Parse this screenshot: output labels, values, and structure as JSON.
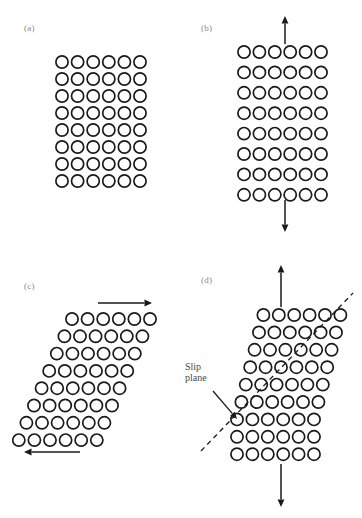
{
  "figure": {
    "background_color": "#ffffff",
    "atom_stroke_color": "#1a1a1a",
    "arrow_color": "#1a1a1a",
    "label_color": "#8a8a8a",
    "annotation_color": "#4a4a4a"
  },
  "panels": [
    {
      "id": "a",
      "label": "(a)",
      "state": "undeformed",
      "lattice": {
        "columns": 6,
        "rows": 8,
        "radius": 6.1,
        "col_spacing": 15.6,
        "row_spacing": 17.0,
        "origin_x": 62,
        "origin_y": 62,
        "row_shear": 0,
        "slip_row_offset": 0
      },
      "arrows": []
    },
    {
      "id": "b",
      "label": "(b)",
      "state": "elastic-tension",
      "lattice": {
        "columns": 6,
        "rows": 8,
        "radius": 6.1,
        "col_spacing": 15.4,
        "row_spacing": 20.4,
        "origin_x": 63,
        "origin_y": 52,
        "row_shear": 0,
        "slip_row_offset": 0
      },
      "arrows": [
        {
          "name": "tension-arrow-up",
          "direction": "up",
          "x": 104,
          "from_y": 44,
          "to_y": 16
        },
        {
          "name": "tension-arrow-down",
          "direction": "down",
          "x": 104,
          "from_y": 200,
          "to_y": 232
        }
      ]
    },
    {
      "id": "c",
      "label": "(c)",
      "state": "elastic-shear",
      "lattice": {
        "columns": 6,
        "rows": 8,
        "radius": 6.1,
        "col_spacing": 15.6,
        "row_spacing": 17.3,
        "origin_x": 72,
        "origin_y": 60,
        "row_shear": -7.6,
        "slip_row_offset": 0
      },
      "arrows": [
        {
          "name": "shear-arrow-top",
          "direction": "right",
          "y": 44,
          "from_x": 98,
          "to_x": 152
        },
        {
          "name": "shear-arrow-bottom",
          "direction": "left",
          "y": 193,
          "from_x": 80,
          "to_x": 24
        }
      ]
    },
    {
      "id": "d",
      "label": "(d)",
      "state": "plastic-slip",
      "lattice": {
        "columns": 6,
        "rows": 9,
        "radius": 6.1,
        "col_spacing": 15.4,
        "row_spacing": 17.4,
        "origin_x": 56,
        "origin_y": 56,
        "row_shear": 0,
        "slip_row_offset": 4.4
      },
      "slip_plane": {
        "label_line_1": "Slip",
        "label_line_2": "plane",
        "label_x": 4,
        "label_y": 102,
        "line_from_x": 20,
        "line_from_y": 192,
        "line_to_x": 172,
        "line_to_y": 34,
        "pointer_from_x": 32,
        "pointer_from_y": 132,
        "pointer_to_x": 56,
        "pointer_to_y": 160
      },
      "arrows": [
        {
          "name": "tension-arrow-up",
          "direction": "up",
          "x": 100,
          "from_y": 48,
          "to_y": 6
        },
        {
          "name": "tension-arrow-down",
          "direction": "down",
          "x": 100,
          "from_y": 205,
          "to_y": 248
        }
      ]
    }
  ]
}
